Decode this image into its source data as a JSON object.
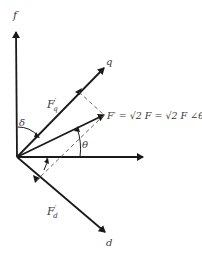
{
  "diagram": {
    "axes": {
      "f": {
        "label": "f"
      },
      "q": {
        "label": "q"
      },
      "d": {
        "label": "d"
      }
    },
    "vectors": {
      "Fq": {
        "label": "F",
        "prime": "′",
        "sub": "q"
      },
      "Fd": {
        "label": "F",
        "prime": "′",
        "sub": "d"
      },
      "F": {
        "equation": "F′ = √2 F = √2 F ∠θ"
      }
    },
    "angles": {
      "delta": "δ",
      "theta": "θ"
    },
    "colors": {
      "line": "#1a1a1a",
      "text": "#3a3a3a"
    }
  }
}
